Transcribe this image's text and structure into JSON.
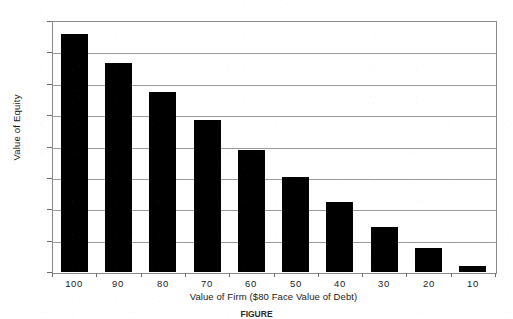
{
  "chart_data": {
    "type": "bar",
    "title": "",
    "xlabel": "Value of Firm ($80 Face Value of Debt)",
    "ylabel": "Value of Equity",
    "categories": [
      "100",
      "90",
      "80",
      "70",
      "60",
      "50",
      "40",
      "30",
      "20",
      "10"
    ],
    "values": [
      76,
      66.5,
      57.5,
      48.3,
      39,
      30.3,
      22.2,
      14.2,
      7.5,
      2
    ],
    "series": [
      {
        "name": "Value of Equity",
        "values": [
          76,
          66.5,
          57.5,
          48.3,
          39,
          30.3,
          22.2,
          14.2,
          7.5,
          2
        ]
      }
    ],
    "ylim": [
      0,
      80
    ],
    "yticks": [
      0,
      10,
      20,
      30,
      40,
      50,
      60,
      70,
      80
    ],
    "ytick_labels": [
      "0",
      "10",
      "20",
      "30",
      "40",
      "50",
      "60",
      "70",
      "80"
    ],
    "grid": "horizontal",
    "legend": "none",
    "bar_color": "#000000",
    "background_color": "#ffffff",
    "gridline_color": "#9a9a9a",
    "axis_color": "#8a8a8a"
  },
  "caption": {
    "figure_number": "FIGURE",
    "text": ""
  }
}
